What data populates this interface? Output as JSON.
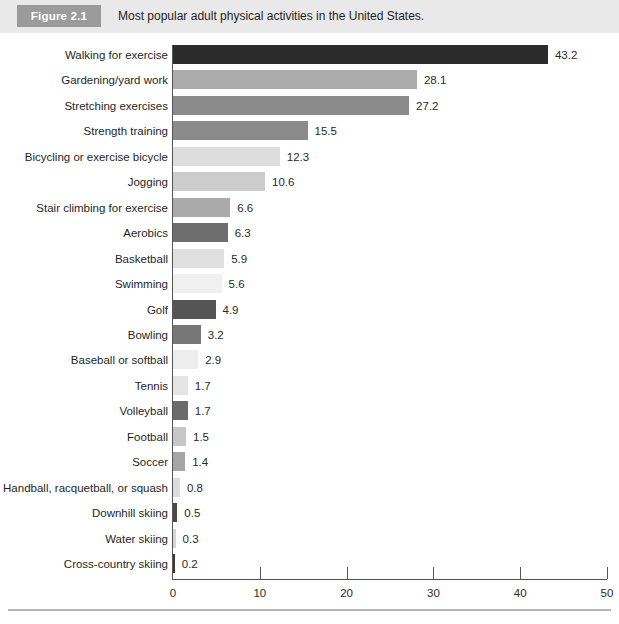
{
  "figure": {
    "badge_label": "Figure 2.1",
    "caption": "Most popular adult physical activities in the United States.",
    "badge_color": "#9b9b9b",
    "band_color": "#e9e9e9"
  },
  "chart_data": {
    "type": "bar",
    "orientation": "horizontal",
    "title": "Most popular adult physical activities in the United States.",
    "xlabel": "",
    "ylabel": "",
    "xlim": [
      0,
      50
    ],
    "xticks": [
      0,
      10,
      20,
      30,
      40,
      50
    ],
    "xtick_labels": [
      "0",
      "10",
      "20",
      "30",
      "40",
      "50"
    ],
    "grid": false,
    "legend": null,
    "show_value_labels": true,
    "categories": [
      "Walking for exercise",
      "Gardening/yard work",
      "Stretching exercises",
      "Strength training",
      "Bicycling or exercise bicycle",
      "Jogging",
      "Stair climbing for exercise",
      "Aerobics",
      "Basketball",
      "Swimming",
      "Golf",
      "Bowling",
      "Baseball or softball",
      "Tennis",
      "Volleyball",
      "Football",
      "Soccer",
      "Handball, racquetball, or squash",
      "Downhill skiing",
      "Water skiing",
      "Cross-country skiing"
    ],
    "values": [
      43.2,
      28.1,
      27.2,
      15.5,
      12.3,
      10.6,
      6.6,
      6.3,
      5.9,
      5.6,
      4.9,
      3.2,
      2.9,
      1.7,
      1.7,
      1.5,
      1.4,
      0.8,
      0.5,
      0.3,
      0.2
    ],
    "value_labels": [
      "43.2",
      "28.1",
      "27.2",
      "15.5",
      "12.3",
      "10.6",
      "6.6",
      "6.3",
      "5.9",
      "5.6",
      "4.9",
      "3.2",
      "2.9",
      "1.7",
      "1.7",
      "1.5",
      "1.4",
      "0.8",
      "0.5",
      "0.3",
      "0.2"
    ],
    "bar_colors": [
      "#2b2b2b",
      "#ababab",
      "#8b8b8b",
      "#8b8b8b",
      "#dddddd",
      "#cccccc",
      "#aaaaaa",
      "#6e6e6e",
      "#e0e0e0",
      "#f0f0f0",
      "#555555",
      "#777777",
      "#ededed",
      "#e4e4e4",
      "#6b6b6b",
      "#c6c6c6",
      "#a5a5a5",
      "#dcdcdc",
      "#4a4a4a",
      "#d6d6d6",
      "#3a3a3a"
    ]
  }
}
